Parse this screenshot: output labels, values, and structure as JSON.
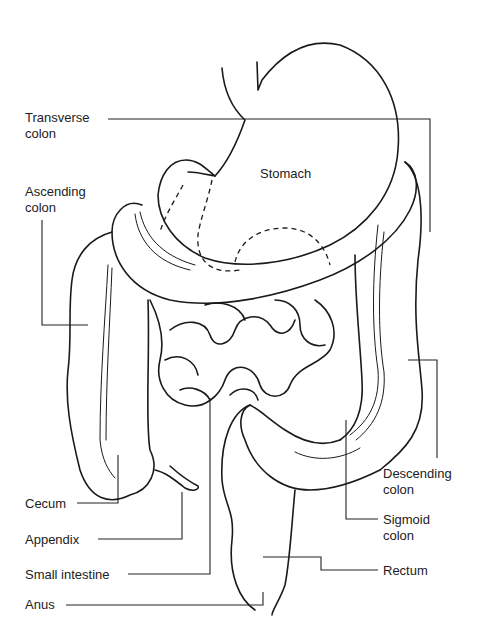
{
  "figure": {
    "colors": {
      "line": "#1a1a1a",
      "text": "#222222",
      "background": "#ffffff"
    }
  },
  "labels": {
    "transverse_colon": "Transverse\ncolon",
    "ascending_colon": "Ascending\ncolon",
    "stomach": "Stomach",
    "cecum": "Cecum",
    "appendix": "Appendix",
    "small_intestine": "Small intestine",
    "anus": "Anus",
    "descending_colon": "Descending\ncolon",
    "sigmoid_colon": "Sigmoid\ncolon",
    "rectum": "Rectum"
  }
}
